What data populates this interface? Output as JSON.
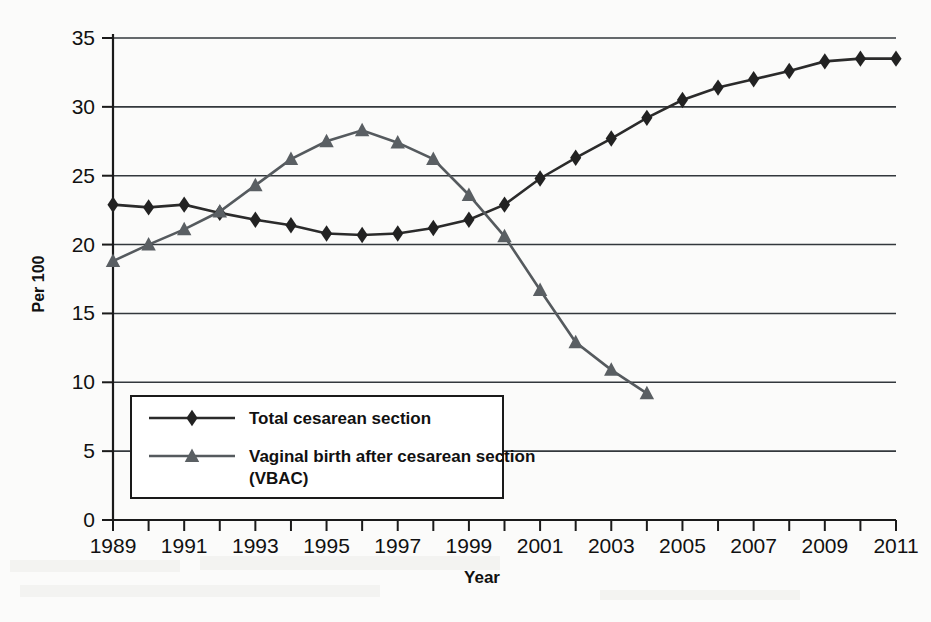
{
  "chart_data": {
    "type": "line",
    "title": "",
    "xlabel": "Year",
    "ylabel": "Per 100",
    "xlim": [
      1989,
      2011
    ],
    "ylim": [
      0,
      35
    ],
    "ytick_step": 5,
    "xtick_step": 1,
    "xtick_label_step": 2,
    "grid": true,
    "legend_position": "inside-lower-left",
    "yticks": [
      "0",
      "5",
      "10",
      "15",
      "20",
      "25",
      "30",
      "35"
    ],
    "ytick_values": [
      0,
      5,
      10,
      15,
      20,
      25,
      30,
      35
    ],
    "x": [
      1989,
      1990,
      1991,
      1992,
      1993,
      1994,
      1995,
      1996,
      1997,
      1998,
      1999,
      2000,
      2001,
      2002,
      2003,
      2004,
      2005,
      2006,
      2007,
      2008,
      2009,
      2010,
      2011
    ],
    "xtick_labels": [
      "1989",
      "",
      "1991",
      "",
      "1993",
      "",
      "1995",
      "",
      "1997",
      "",
      "1999",
      "",
      "2001",
      "",
      "2003",
      "",
      "2005",
      "",
      "2007",
      "",
      "2009",
      "",
      "2011"
    ],
    "series": [
      {
        "name": "Total cesarean section",
        "marker": "diamond",
        "color": "#222222",
        "values": [
          22.9,
          22.7,
          22.9,
          22.3,
          21.8,
          21.4,
          20.8,
          20.7,
          20.8,
          21.2,
          21.8,
          22.9,
          24.8,
          26.3,
          27.7,
          29.2,
          30.5,
          31.4,
          32.0,
          32.6,
          33.3,
          33.5,
          33.5
        ]
      },
      {
        "name": "Vaginal birth after cesarean section (VBAC)",
        "marker": "triangle",
        "color": "#5a5f63",
        "values": [
          18.8,
          20.0,
          21.1,
          22.4,
          24.3,
          26.2,
          27.5,
          28.3,
          27.4,
          26.2,
          23.6,
          20.6,
          16.7,
          12.9,
          10.9,
          9.2,
          null,
          null,
          null,
          null,
          null,
          null,
          null
        ]
      }
    ],
    "legend": [
      {
        "label": "Total cesarean section",
        "marker": "diamond",
        "color": "#222222"
      },
      {
        "label": "Vaginal birth after cesarean section (VBAC)",
        "marker": "triangle",
        "color": "#5a5f63"
      }
    ]
  },
  "axis": {
    "y_title": "Per 100",
    "x_title": "Year"
  },
  "colors": {
    "series_a": "#222222",
    "series_b": "#5a5f63",
    "grid": "#33383c",
    "axis": "#1a1a1a",
    "background": "#fbfbfa"
  }
}
